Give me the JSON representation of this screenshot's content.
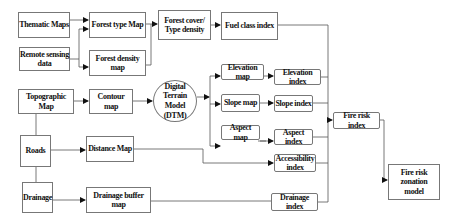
{
  "diagram": {
    "type": "flowchart",
    "nodes": {
      "thematic_maps": "Thematic Maps",
      "remote_sensing": "Remote sensing data",
      "forest_type_map": "Forest type Map",
      "forest_density_map": "Forest density map",
      "forest_cover": "Forest cover/ Type density",
      "fuel_class_index": "Fuel class index",
      "topographic_map": "Topographic Map",
      "contour_map": "Contour map",
      "dtm": "Digital Terrain Model (DTM)",
      "elevation_map": "Elevation map",
      "elevation_index": "Elevation index",
      "slope_map": "Slope map",
      "slope_index": "Slope index",
      "aspect_map": "Aspect map",
      "aspect_index": "Aspect index",
      "roads": "Roads",
      "distance_map": "Distance Map",
      "accessibility_index": "Accessibility index",
      "drainage": "Drainage",
      "drainage_buffer_map": "Drainage buffer map",
      "drainage_index": "Drainage index",
      "fire_risk_index": "Fire risk index",
      "fire_risk_zonation": "Fire risk zonation model"
    },
    "edges": [
      [
        "Thematic Maps",
        "Forest type Map"
      ],
      [
        "Remote sensing data",
        "Forest type Map"
      ],
      [
        "Remote sensing data",
        "Forest density map"
      ],
      [
        "Forest type Map",
        "Forest cover/ Type density"
      ],
      [
        "Forest density map",
        "Forest cover/ Type density"
      ],
      [
        "Forest cover/ Type density",
        "Fuel class index"
      ],
      [
        "Topographic Map",
        "Contour map"
      ],
      [
        "Contour map",
        "Digital Terrain Model (DTM)"
      ],
      [
        "Digital Terrain Model (DTM)",
        "Elevation map"
      ],
      [
        "Digital Terrain Model (DTM)",
        "Slope map"
      ],
      [
        "Digital Terrain Model (DTM)",
        "Aspect map"
      ],
      [
        "Elevation map",
        "Elevation index"
      ],
      [
        "Slope map",
        "Slope index"
      ],
      [
        "Aspect map",
        "Aspect index"
      ],
      [
        "Topographic Map",
        "Roads"
      ],
      [
        "Roads",
        "Drainage"
      ],
      [
        "Roads",
        "Distance Map"
      ],
      [
        "Distance Map",
        "Accessibility index"
      ],
      [
        "Drainage",
        "Drainage buffer map"
      ],
      [
        "Drainage buffer map",
        "Drainage index"
      ],
      [
        "Fuel class index",
        "Fire risk index"
      ],
      [
        "Elevation index",
        "Fire risk index"
      ],
      [
        "Slope index",
        "Fire risk index"
      ],
      [
        "Aspect index",
        "Fire risk index"
      ],
      [
        "Accessibility index",
        "Fire risk index"
      ],
      [
        "Drainage index",
        "Fire risk index"
      ],
      [
        "Fire risk index",
        "Fire risk zonation model"
      ]
    ]
  },
  "labels": {
    "thematic_maps": "Thematic Maps",
    "remote_sensing_1": "Remote sensing",
    "remote_sensing_2": "data",
    "forest_type_map": "Forest type Map",
    "forest_density_map": "Forest density map",
    "forest_cover_1": "Forest cover/",
    "forest_cover_2": "Type density",
    "fuel_class_index": "Fuel class index",
    "topographic_map": "Topographic Map",
    "contour_map": "Contour map",
    "dtm_1": "Digital Terrain",
    "dtm_2": "Model",
    "dtm_3": "(DTM)",
    "elevation_map": "Elevation map",
    "elevation_index": "Elevation index",
    "slope_map": "Slope map",
    "slope_index": "Slope index",
    "aspect_map": "Aspect map",
    "aspect_index": "Aspect index",
    "roads": "Roads",
    "distance_map": "Distance Map",
    "accessibility_1": "Accessibility",
    "accessibility_2": "index",
    "drainage": "Drainage",
    "drainage_buffer_map": "Drainage buffer map",
    "drainage_index": "Drainage index",
    "fire_risk_index": "Fire risk index",
    "fire_risk_zonation_1": "Fire risk zonation",
    "fire_risk_zonation_2": "model"
  },
  "colors": {
    "line": "#555555",
    "border": "#777777",
    "text": "#111111",
    "background": "#ffffff"
  }
}
